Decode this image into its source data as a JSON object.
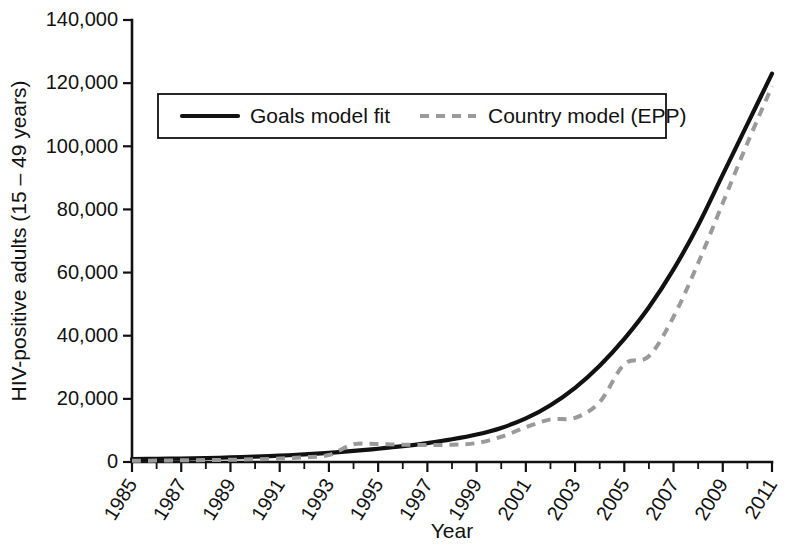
{
  "chart_data": {
    "type": "line",
    "title": "",
    "subtitle": "",
    "xlabel": "Year",
    "ylabel": "HIV-positive adults (15 – 49 years)",
    "xlim": [
      1985,
      2011
    ],
    "ylim": [
      0,
      140000
    ],
    "grid": false,
    "legend_position": "top-left-inside",
    "ytick_labels": [
      "0",
      "20,000",
      "40,000",
      "60,000",
      "80,000",
      "100,000",
      "120,000",
      "140,000"
    ],
    "ytick_values": [
      0,
      20000,
      40000,
      60000,
      80000,
      100000,
      120000,
      140000
    ],
    "xtick_labels": [
      "1985",
      "1987",
      "1989",
      "1991",
      "1993",
      "1995",
      "1997",
      "1999",
      "2001",
      "2003",
      "2005",
      "2007",
      "2009",
      "2011"
    ],
    "xtick_values": [
      1985,
      1987,
      1989,
      1991,
      1993,
      1995,
      1997,
      1999,
      2001,
      2003,
      2005,
      2007,
      2009,
      2011
    ],
    "x": [
      1985,
      1986,
      1987,
      1988,
      1989,
      1990,
      1991,
      1992,
      1993,
      1994,
      1995,
      1996,
      1997,
      1998,
      1999,
      2000,
      2001,
      2002,
      2003,
      2004,
      2005,
      2006,
      2007,
      2008,
      2009,
      2010,
      2011
    ],
    "series": [
      {
        "name": "Goals model fit",
        "style": "solid",
        "color": "#111111",
        "values": [
          900,
          1000,
          1100,
          1250,
          1450,
          1700,
          2000,
          2400,
          2900,
          3500,
          4200,
          5000,
          6000,
          7200,
          8700,
          10800,
          13800,
          18000,
          23500,
          30500,
          39000,
          49000,
          61000,
          75000,
          91000,
          107000,
          123000
        ]
      },
      {
        "name": "Country model (EPP)",
        "style": "dashed",
        "color": "#9a9a9a",
        "values": [
          400,
          450,
          520,
          600,
          700,
          850,
          1100,
          1500,
          2200,
          5600,
          5700,
          5500,
          5400,
          5500,
          6000,
          8000,
          11000,
          13500,
          14000,
          19000,
          31000,
          33500,
          46000,
          63000,
          82000,
          101000,
          119000
        ]
      }
    ]
  },
  "legend": {
    "entries": [
      {
        "label": "Goals model fit",
        "style": "solid",
        "color": "#111111"
      },
      {
        "label": "Country model (EPP)",
        "style": "dashed",
        "color": "#9a9a9a"
      }
    ]
  },
  "colors": {
    "axis": "#111111",
    "background": "#ffffff",
    "goals_model": "#111111",
    "country_model": "#9a9a9a"
  }
}
